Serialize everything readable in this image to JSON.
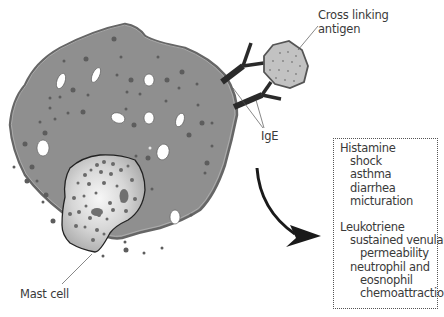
{
  "diagram": {
    "labels": {
      "antigen_line1": "Cross linking",
      "antigen_line2": "antigen",
      "ige": "IgE",
      "mast_cell": "Mast cell"
    },
    "mediators": [
      {
        "name": "Histamine",
        "effects": [
          {
            "text": "shock",
            "indent": 1
          },
          {
            "text": "asthma",
            "indent": 1
          },
          {
            "text": "diarrhea",
            "indent": 1
          },
          {
            "text": "micturation",
            "indent": 1
          }
        ]
      },
      {
        "name": "Leukotriene",
        "effects": [
          {
            "text": "sustained venular",
            "indent": 1
          },
          {
            "text": "permeability",
            "indent": 2
          },
          {
            "text": "neutrophil and",
            "indent": 1
          },
          {
            "text": "eosnophil",
            "indent": 2
          },
          {
            "text": "chemoattraction",
            "indent": 2
          }
        ]
      }
    ],
    "colors": {
      "cytoplasm": "#8f8f8f",
      "membrane": "#6e6e6e",
      "granule": "#5d5d5d",
      "vacuole": "#ffffff",
      "nucleus_center": "#f4f4f4",
      "nucleus_edge": "#a8a8a8",
      "antigen_fill": "#c2c2c2",
      "antibody": "#2a2a2a",
      "text": "#3a3a3a"
    }
  }
}
